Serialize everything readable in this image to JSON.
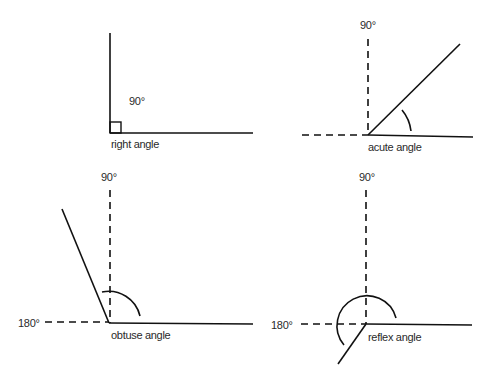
{
  "diagram": {
    "panels": [
      {
        "id": "right",
        "name": "right angle",
        "degree_label": "90°"
      },
      {
        "id": "acute",
        "name": "acute angle",
        "reference_label_90": "90°"
      },
      {
        "id": "obtuse",
        "name": "obtuse angle",
        "reference_label_90": "90°",
        "reference_label_180": "180°"
      },
      {
        "id": "reflex",
        "name": "reflex angle",
        "reference_label_90": "90°",
        "reference_label_180": "180°"
      }
    ],
    "colors": {
      "line": "#111111",
      "text": "#2a2a2a",
      "background": "#ffffff"
    }
  }
}
